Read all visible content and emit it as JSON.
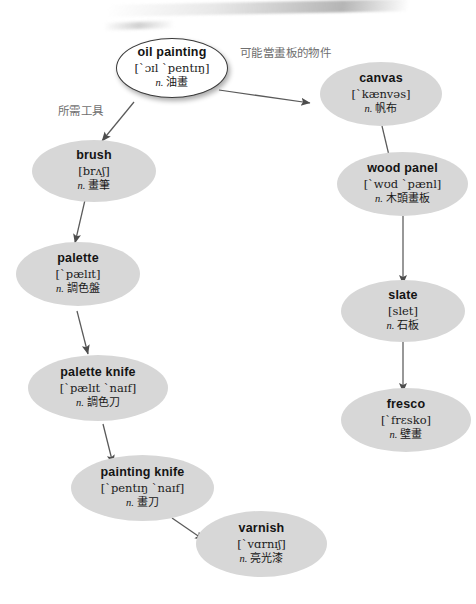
{
  "diagram": {
    "node_fill": "#d7d7d7",
    "root_fill": "#ffffff",
    "edge_color": "#5a5a5a",
    "label_color": "#6f6f6f",
    "nodes": [
      {
        "id": "oil-painting",
        "word": "oil painting",
        "ipa": "[ˋɔɪl ˋpentɪŋ]",
        "pos": "n.",
        "gloss": "油畫"
      },
      {
        "id": "canvas",
        "word": "canvas",
        "ipa": "[ˋkænvəs]",
        "pos": "n.",
        "gloss": "帆布"
      },
      {
        "id": "wood-panel",
        "word": "wood panel",
        "ipa": "[ˋwʊd ˋpænl]",
        "pos": "n.",
        "gloss": "木頭畫板"
      },
      {
        "id": "slate",
        "word": "slate",
        "ipa": "[slet]",
        "pos": "n.",
        "gloss": "石板"
      },
      {
        "id": "fresco",
        "word": "fresco",
        "ipa": "[ˋfrɛsko]",
        "pos": "n.",
        "gloss": "壁畫"
      },
      {
        "id": "brush",
        "word": "brush",
        "ipa": "[brʌʃ]",
        "pos": "n.",
        "gloss": "畫筆"
      },
      {
        "id": "palette",
        "word": "palette",
        "ipa": "[ˋpælɪt]",
        "pos": "n.",
        "gloss": "調色盤"
      },
      {
        "id": "palette-knife",
        "word": "palette knife",
        "ipa": "[ˋpælɪt ˋnaɪf]",
        "pos": "n.",
        "gloss": "調色刀"
      },
      {
        "id": "painting-knife",
        "word": "painting knife",
        "ipa": "[ˋpentɪŋ ˋnaɪf]",
        "pos": "n.",
        "gloss": "畫刀"
      },
      {
        "id": "varnish",
        "word": "varnish",
        "ipa": "[ˋvɑrnɪʃ]",
        "pos": "n.",
        "gloss": "亮光漆"
      }
    ],
    "edge_labels": {
      "tools": "所需工具",
      "surfaces": "可能當畫板的物件"
    }
  }
}
